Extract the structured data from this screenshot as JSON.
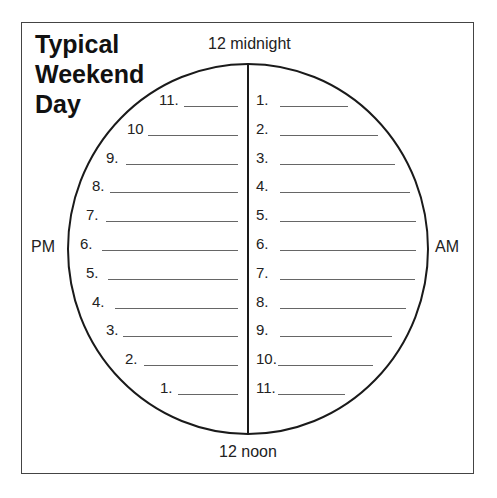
{
  "worksheet": {
    "title_lines": [
      "Typical",
      "Weekend",
      "Day"
    ],
    "top_label": "12 midnight",
    "bottom_label": "12 noon",
    "left_label": "PM",
    "right_label": "AM",
    "pm_rows": [
      {
        "num": "11.",
        "text_x": 159,
        "line_x1": 184,
        "line_x2": 238
      },
      {
        "num": "10",
        "text_x": 127,
        "line_x1": 148,
        "line_x2": 238
      },
      {
        "num": "9.",
        "text_x": 106,
        "line_x1": 126,
        "line_x2": 238
      },
      {
        "num": "8.",
        "text_x": 92,
        "line_x1": 110,
        "line_x2": 238
      },
      {
        "num": "7.",
        "text_x": 86,
        "line_x1": 106,
        "line_x2": 238
      },
      {
        "num": "6.",
        "text_x": 80,
        "line_x1": 102,
        "line_x2": 238
      },
      {
        "num": "5.",
        "text_x": 86,
        "line_x1": 108,
        "line_x2": 238
      },
      {
        "num": "4.",
        "text_x": 92,
        "line_x1": 115,
        "line_x2": 238
      },
      {
        "num": "3.",
        "text_x": 106,
        "line_x1": 123,
        "line_x2": 238
      },
      {
        "num": "2.",
        "text_x": 125,
        "line_x1": 144,
        "line_x2": 238
      },
      {
        "num": "1.",
        "text_x": 160,
        "line_x1": 178,
        "line_x2": 238
      }
    ],
    "am_rows": [
      {
        "num": "1.",
        "line_x2": 348
      },
      {
        "num": "2.",
        "line_x2": 378
      },
      {
        "num": "3.",
        "line_x2": 395
      },
      {
        "num": "4.",
        "line_x2": 410
      },
      {
        "num": "5.",
        "line_x2": 416
      },
      {
        "num": "6.",
        "line_x2": 416
      },
      {
        "num": "7.",
        "line_x2": 415
      },
      {
        "num": "8.",
        "line_x2": 406
      },
      {
        "num": "9.",
        "line_x2": 392
      },
      {
        "num": "10.",
        "line_x2": 373
      },
      {
        "num": "11.",
        "line_x2": 345
      }
    ],
    "colors": {
      "ink": "#1a1a1a",
      "rule": "#666666",
      "frame": "#444444"
    }
  }
}
